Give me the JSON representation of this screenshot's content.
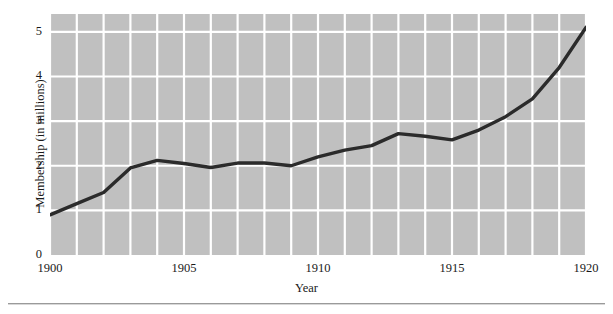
{
  "chart_data": {
    "type": "line",
    "title": "",
    "subtitle": "",
    "xlabel": "Year",
    "ylabel": "Membership (in millions)",
    "xlim": [
      1900,
      1920
    ],
    "ylim": [
      0,
      5.4
    ],
    "x_tick_labels": [
      "1900",
      "1905",
      "1910",
      "1915",
      "1920"
    ],
    "x_ticks": [
      1900,
      1905,
      1910,
      1915,
      1920
    ],
    "y_tick_labels": [
      "0",
      "1",
      "2",
      "3",
      "4",
      "5"
    ],
    "y_ticks": [
      0,
      1,
      2,
      3,
      4,
      5
    ],
    "grid": true,
    "grid_color": "#ffffff",
    "plot_background": "#c0c0c0",
    "line_color": "#2b2b2b",
    "line_width": 3.4,
    "legend": null,
    "legend_position": "none",
    "annotations": [],
    "x": [
      1900,
      1901,
      1902,
      1903,
      1904,
      1905,
      1906,
      1907,
      1908,
      1909,
      1910,
      1911,
      1912,
      1913,
      1914,
      1915,
      1916,
      1917,
      1918,
      1919,
      1920
    ],
    "values": [
      0.9,
      1.15,
      1.4,
      1.95,
      2.12,
      2.05,
      1.96,
      2.06,
      2.06,
      2.0,
      2.2,
      2.35,
      2.45,
      2.72,
      2.66,
      2.58,
      2.8,
      3.1,
      3.5,
      4.2,
      5.1
    ],
    "series": [
      {
        "name": "Membership",
        "values": [
          0.9,
          1.15,
          1.4,
          1.95,
          2.12,
          2.05,
          1.96,
          2.06,
          2.06,
          2.0,
          2.2,
          2.35,
          2.45,
          2.72,
          2.66,
          2.58,
          2.8,
          3.1,
          3.5,
          4.2,
          5.1
        ]
      }
    ]
  },
  "axes": {
    "y_label_text": "Membership (in millions)",
    "x_label_text": "Year"
  }
}
